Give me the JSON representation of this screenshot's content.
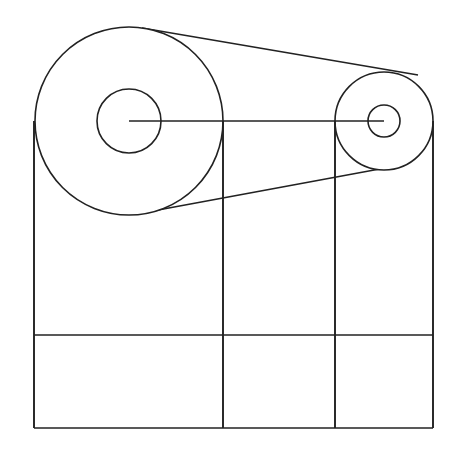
{
  "diagram": {
    "stroke_color": "#222222",
    "background": "#ffffff",
    "large_pulley": {
      "cx": 129,
      "cy": 121,
      "r_outer": 94,
      "r_inner": 32
    },
    "small_pulley": {
      "cx": 384,
      "cy": 121,
      "r_outer": 49,
      "r_inner": 16
    },
    "belt": {
      "top": {
        "x1": 142,
        "y1": 28,
        "x2": 418,
        "y2": 75
      },
      "bottom": {
        "x1": 158,
        "y1": 210,
        "x2": 385,
        "y2": 168
      }
    },
    "center_line": {
      "x1": 129,
      "y1": 121,
      "x2": 384,
      "y2": 121
    },
    "grid": {
      "x_lines": [
        34,
        223,
        335,
        433
      ],
      "top_y": 121,
      "mid_y": 335,
      "bottom_y": 428
    }
  }
}
